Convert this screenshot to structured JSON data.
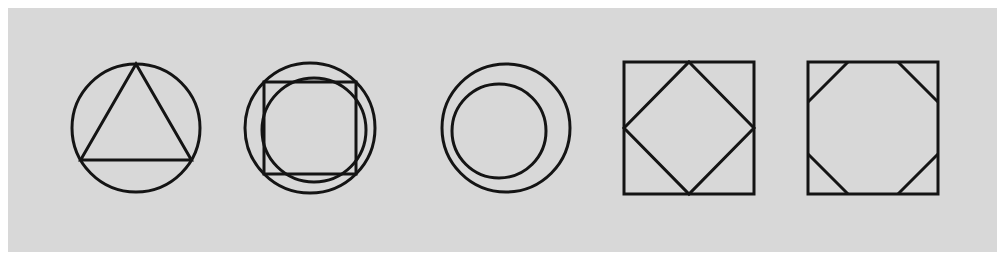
{
  "sheet": {
    "width": 1008,
    "height": 273,
    "background_color": "#ffffff",
    "panel_color": "#d8d8d8",
    "ink_color": "#141414",
    "stroke_width": 3,
    "panel": {
      "x": 8,
      "y": 8,
      "width": 989,
      "height": 244
    }
  },
  "figures": [
    {
      "index": 1,
      "name": "circle-with-inscribed-triangle",
      "description": "Circle with an inscribed equilateral triangle, apex pointing up",
      "slot": {
        "x": 8,
        "y": 8,
        "width": 200,
        "height": 244
      },
      "shapes": [
        {
          "type": "circle",
          "name": "outer-circle",
          "cx": 128,
          "cy": 128,
          "r": 64
        },
        {
          "type": "polygon",
          "name": "inscribed-triangle",
          "points": "128,64 183.4,160 72.6,160"
        }
      ]
    },
    {
      "index": 2,
      "name": "circle-square-circle-nest",
      "description": "Outer circle with a square whose corners touch it, and an inner circle inscribed in the square, slightly offset",
      "slot": {
        "x": 198,
        "y": 8,
        "width": 210,
        "height": 244
      },
      "shapes": [
        {
          "type": "circle",
          "name": "outer-circle",
          "cx": 112,
          "cy": 128,
          "r": 65
        },
        {
          "type": "rect",
          "name": "middle-square",
          "x": 66,
          "y": 82,
          "width": 92,
          "height": 92
        },
        {
          "type": "circle",
          "name": "inner-circle",
          "cx": 116,
          "cy": 130,
          "r": 52
        }
      ]
    },
    {
      "index": 3,
      "name": "concentric-circles-annulus",
      "description": "Two nested circles forming a ring, inner circle offset slightly left and down",
      "slot": {
        "x": 408,
        "y": 8,
        "width": 200,
        "height": 244
      },
      "shapes": [
        {
          "type": "circle",
          "name": "outer-circle",
          "cx": 98,
          "cy": 128,
          "r": 64
        },
        {
          "type": "circle",
          "name": "inner-circle",
          "cx": 91,
          "cy": 131,
          "r": 47
        }
      ]
    },
    {
      "index": 4,
      "name": "square-with-inscribed-diamond",
      "description": "Square containing a rotated square whose vertices touch the midpoints of the outer square's sides",
      "slot": {
        "x": 608,
        "y": 8,
        "width": 200,
        "height": 244
      },
      "shapes": [
        {
          "type": "rect",
          "name": "outer-square",
          "x": 16,
          "y": 62,
          "width": 130,
          "height": 132
        },
        {
          "type": "polygon",
          "name": "inscribed-diamond",
          "points": "81,62 146,128 81,194 16,128"
        }
      ]
    },
    {
      "index": 5,
      "name": "square-with-cut-corners",
      "description": "Square with all four corners cut by diagonal chords, forming an octagon outline",
      "slot": {
        "x": 798,
        "y": 8,
        "width": 200,
        "height": 244
      },
      "shapes": [
        {
          "type": "rect",
          "name": "outer-square",
          "x": 10,
          "y": 62,
          "width": 130,
          "height": 132
        },
        {
          "type": "line",
          "name": "corner-chord-top-left",
          "x1": 10,
          "y1": 102,
          "x2": 50,
          "y2": 62
        },
        {
          "type": "line",
          "name": "corner-chord-top-right",
          "x1": 100,
          "y1": 62,
          "x2": 140,
          "y2": 102
        },
        {
          "type": "line",
          "name": "corner-chord-bottom-right",
          "x1": 140,
          "y1": 154,
          "x2": 100,
          "y2": 194
        },
        {
          "type": "line",
          "name": "corner-chord-bottom-left",
          "x1": 50,
          "y1": 194,
          "x2": 10,
          "y2": 154
        }
      ]
    }
  ]
}
